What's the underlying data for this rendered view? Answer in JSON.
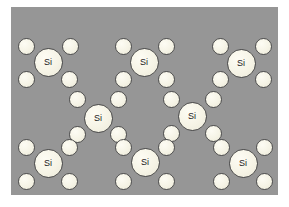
{
  "figure": {
    "kind": "silicon-crystal-lattice-diagram",
    "width": 289,
    "height": 207,
    "background_color": "#ffffff",
    "panel": {
      "color": "#969696",
      "x": 11,
      "y": 7,
      "width": 267,
      "height": 188
    },
    "atom_label": "Si",
    "atom_fill_color": "#f6f4e6",
    "atom_outline_color": "#4a4a4a",
    "electron_fill_color": "#f5f3e5",
    "electron_outline_color": "#4f4f4f",
    "si_atom_diameter": 29,
    "electron_diameter": 17
  },
  "atoms": [
    {
      "id": "si-top-left",
      "label": "Si",
      "cx": 48,
      "cy": 62,
      "electrons": [
        {
          "cx": 26,
          "cy": 46
        },
        {
          "cx": 70,
          "cy": 46
        },
        {
          "cx": 26,
          "cy": 79
        },
        {
          "cx": 69,
          "cy": 79
        }
      ]
    },
    {
      "id": "si-top-middle",
      "label": "Si",
      "cx": 144,
      "cy": 62,
      "electrons": [
        {
          "cx": 123,
          "cy": 46
        },
        {
          "cx": 166,
          "cy": 46
        },
        {
          "cx": 123,
          "cy": 79
        },
        {
          "cx": 166,
          "cy": 79
        }
      ]
    },
    {
      "id": "si-top-right",
      "label": "Si",
      "cx": 241,
      "cy": 63,
      "electrons": [
        {
          "cx": 220,
          "cy": 46
        },
        {
          "cx": 263,
          "cy": 46
        },
        {
          "cx": 220,
          "cy": 79
        },
        {
          "cx": 263,
          "cy": 79
        }
      ]
    },
    {
      "id": "si-middle-left",
      "label": "Si",
      "cx": 98,
      "cy": 118,
      "electrons": [
        {
          "cx": 77,
          "cy": 99
        },
        {
          "cx": 118,
          "cy": 99
        },
        {
          "cx": 77,
          "cy": 134
        },
        {
          "cx": 118,
          "cy": 134
        }
      ]
    },
    {
      "id": "si-middle-right",
      "label": "Si",
      "cx": 192,
      "cy": 116,
      "electrons": [
        {
          "cx": 171,
          "cy": 99
        },
        {
          "cx": 213,
          "cy": 99
        },
        {
          "cx": 171,
          "cy": 133
        },
        {
          "cx": 213,
          "cy": 133
        }
      ]
    },
    {
      "id": "si-bottom-left",
      "label": "Si",
      "cx": 48,
      "cy": 163,
      "electrons": [
        {
          "cx": 26,
          "cy": 147
        },
        {
          "cx": 69,
          "cy": 147
        },
        {
          "cx": 26,
          "cy": 181
        },
        {
          "cx": 69,
          "cy": 181
        }
      ]
    },
    {
      "id": "si-bottom-middle",
      "label": "Si",
      "cx": 145,
      "cy": 162,
      "electrons": [
        {
          "cx": 123,
          "cy": 147
        },
        {
          "cx": 166,
          "cy": 147
        },
        {
          "cx": 123,
          "cy": 181
        },
        {
          "cx": 166,
          "cy": 181
        }
      ]
    },
    {
      "id": "si-bottom-right",
      "label": "Si",
      "cx": 243,
      "cy": 163,
      "electrons": [
        {
          "cx": 221,
          "cy": 147
        },
        {
          "cx": 264,
          "cy": 147
        },
        {
          "cx": 221,
          "cy": 181
        },
        {
          "cx": 264,
          "cy": 181
        }
      ]
    }
  ]
}
